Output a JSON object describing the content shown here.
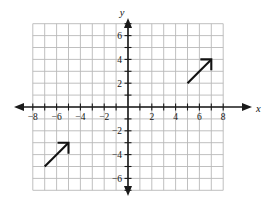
{
  "chart_data": {
    "type": "scatter",
    "title": "",
    "xlabel": "x",
    "ylabel": "y",
    "xlim": [
      -9,
      9
    ],
    "ylim": [
      -7,
      7
    ],
    "grid": true,
    "grid_step": 1,
    "legend": "none",
    "x_tick_labels": [
      "-8",
      "-6",
      "-4",
      "-2",
      "2",
      "4",
      "6",
      "8"
    ],
    "x_tick_values": [
      -8,
      -6,
      -4,
      -2,
      2,
      4,
      6,
      8
    ],
    "y_tick_labels": [
      "6",
      "4",
      "2",
      "-2",
      "-4",
      "-6"
    ],
    "y_tick_values": [
      6,
      4,
      2,
      -2,
      -4,
      -6
    ],
    "annotations": [
      {
        "name": "upper-right-vector",
        "kind": "arrow",
        "tail": [
          5,
          2
        ],
        "tip": [
          7,
          4
        ],
        "slope": 1
      },
      {
        "name": "lower-left-vector",
        "kind": "arrow",
        "tail": [
          -7,
          -5
        ],
        "tip": [
          -5,
          -3
        ],
        "slope": 1
      }
    ]
  },
  "axes": {
    "x_axis_label": "x",
    "y_axis_label": "y"
  },
  "colors": {
    "grid": "#b9b9b9",
    "axis": "#1a1a1a",
    "vector": "#121212",
    "background": "#ffffff"
  }
}
